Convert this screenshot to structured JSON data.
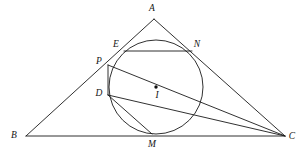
{
  "figure": {
    "background_color": "#ffffff",
    "stroke_color": "#1a1a1a",
    "canvas": {
      "width": 306,
      "height": 153
    }
  },
  "labels": {
    "A": "A",
    "B": "B",
    "C": "C",
    "D": "D",
    "E": "E",
    "I": "I",
    "M": "M",
    "N": "N",
    "P": "P"
  },
  "label_positions": {
    "A": {
      "x": 152,
      "y": 9
    },
    "B": {
      "x": 14,
      "y": 136
    },
    "C": {
      "x": 292,
      "y": 137
    },
    "D": {
      "x": 99,
      "y": 94
    },
    "E": {
      "x": 116,
      "y": 45
    },
    "I": {
      "x": 157,
      "y": 96
    },
    "M": {
      "x": 152,
      "y": 145
    },
    "N": {
      "x": 197,
      "y": 45
    },
    "P": {
      "x": 99,
      "y": 62
    }
  },
  "points": {
    "A": {
      "x": 154,
      "y": 19
    },
    "B": {
      "x": 26,
      "y": 136
    },
    "C": {
      "x": 285,
      "y": 136
    },
    "D": {
      "x": 108,
      "y": 95
    },
    "E": {
      "x": 124,
      "y": 51
    },
    "I": {
      "x": 156,
      "y": 87
    },
    "M": {
      "x": 152,
      "y": 134
    },
    "N": {
      "x": 192,
      "y": 51
    },
    "P": {
      "x": 108,
      "y": 65
    }
  },
  "circle": {
    "name": "incircle",
    "center": {
      "x": 156,
      "y": 87
    },
    "radius": 47
  },
  "segments": [
    {
      "name": "side-AB",
      "from": "A",
      "to": "B"
    },
    {
      "name": "side-AC",
      "from": "A",
      "to": "C"
    },
    {
      "name": "side-BC",
      "from": "B",
      "to": "C"
    },
    {
      "name": "chord-EN",
      "from": "E",
      "to": "N"
    },
    {
      "name": "segment-PC",
      "from": "P",
      "to": "C"
    },
    {
      "name": "segment-PD",
      "from": "P",
      "to": "D"
    },
    {
      "name": "segment-DM",
      "from": "D",
      "to": "M"
    },
    {
      "name": "segment-DC",
      "from": "D",
      "to": "C"
    }
  ]
}
